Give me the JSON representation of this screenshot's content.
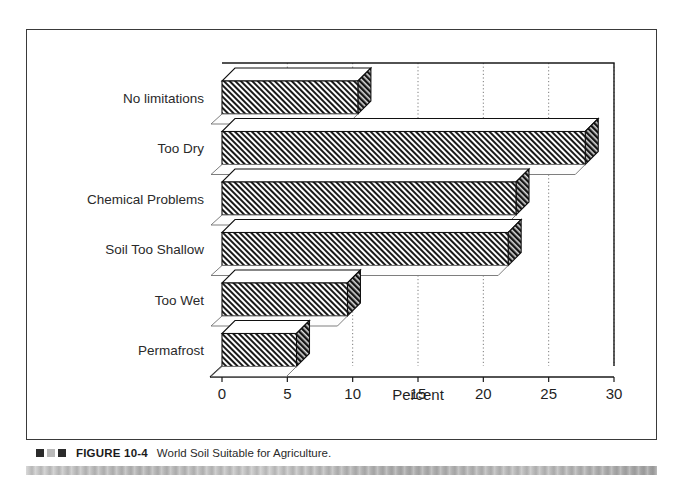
{
  "figure": {
    "caption_marker_colors": [
      "#2b2b2b",
      "#b9b9b9",
      "#2b2b2b"
    ],
    "figure_number": "FIGURE 10-4",
    "caption": "World Soil Suitable for Agriculture."
  },
  "chart_data": {
    "type": "bar",
    "orientation": "horizontal",
    "style": "3d-hatched",
    "title": "",
    "xlabel": "Percent",
    "ylabel": "",
    "categories": [
      "No limitations",
      "Too Dry",
      "Chemical Problems",
      "Soil Too Shallow",
      "Too Wet",
      "Permafrost"
    ],
    "values": [
      10.4,
      27.8,
      22.5,
      21.9,
      9.6,
      5.7
    ],
    "xlim": [
      0,
      30
    ],
    "xticks": [
      0,
      5,
      10,
      15,
      20,
      25,
      30
    ],
    "xtick_labels": [
      "0",
      "5",
      "10",
      "15",
      "20",
      "25",
      "30"
    ],
    "grid": "vertical-dotted",
    "legend": "none",
    "bar_face_color": "#ffffff",
    "bar_hatch_color": "#1a1a1a",
    "bar_outline_color": "#111111"
  }
}
